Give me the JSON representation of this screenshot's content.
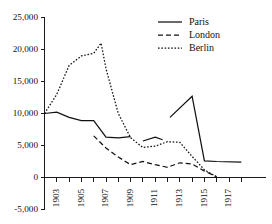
{
  "chart_data": {
    "type": "line",
    "title": "",
    "subtitle": "",
    "xlabel": "",
    "ylabel": "",
    "xlim": [
      1902,
      1918
    ],
    "ylim": [
      -5000,
      25000
    ],
    "grid": false,
    "legend_position": "top-right",
    "x": [
      1902,
      1903,
      1904,
      1905,
      1906,
      1907,
      1908,
      1909,
      1910,
      1911,
      1912,
      1913,
      1914,
      1915,
      1916,
      1917,
      1918
    ],
    "y_ticks": [
      -5000,
      0,
      5000,
      10000,
      15000,
      20000,
      25000
    ],
    "y_tick_labels": [
      "-5,000",
      "0",
      "5,000",
      "10,000",
      "15,000",
      "20,000",
      "25,000"
    ],
    "x_ticks": [
      1902,
      1903,
      1904,
      1905,
      1906,
      1907,
      1908,
      1909,
      1910,
      1911,
      1912,
      1913,
      1914,
      1915,
      1916,
      1917,
      1918
    ],
    "x_tick_labels": [
      "",
      "1903",
      "",
      "1905",
      "",
      "1907",
      "",
      "1909",
      "",
      "1911",
      "",
      "1913",
      "",
      "1915",
      "",
      "1917",
      ""
    ],
    "series": [
      {
        "name": "Paris",
        "style": "solid",
        "points": [
          {
            "x": 1902,
            "y": 10000
          },
          {
            "x": 1903,
            "y": 10200
          },
          {
            "x": 1904,
            "y": 9400
          },
          {
            "x": 1905,
            "y": 8900
          },
          {
            "x": 1906,
            "y": 8900
          },
          {
            "x": 1907,
            "y": 6300
          },
          {
            "x": 1908,
            "y": 6200
          },
          {
            "x": 1909,
            "y": 6400
          }
        ],
        "points_segment2": [
          {
            "x": 1910,
            "y": 5700
          },
          {
            "x": 1911,
            "y": 6300
          },
          {
            "x": 1911.6,
            "y": 5900
          }
        ],
        "points_segment3": [
          {
            "x": 1912.2,
            "y": 9400
          },
          {
            "x": 1914,
            "y": 12700
          },
          {
            "x": 1915,
            "y": 2600
          },
          {
            "x": 1916,
            "y": 2500
          },
          {
            "x": 1918,
            "y": 2400
          }
        ]
      },
      {
        "name": "London",
        "style": "dashed",
        "points": [
          {
            "x": 1906,
            "y": 6500
          },
          {
            "x": 1907,
            "y": 4600
          },
          {
            "x": 1908,
            "y": 3200
          },
          {
            "x": 1909,
            "y": 2000
          },
          {
            "x": 1910,
            "y": 2500
          },
          {
            "x": 1911,
            "y": 2000
          },
          {
            "x": 1912,
            "y": 1600
          },
          {
            "x": 1913,
            "y": 2300
          },
          {
            "x": 1914,
            "y": 2100
          },
          {
            "x": 1915,
            "y": 1000
          },
          {
            "x": 1916,
            "y": 100
          }
        ]
      },
      {
        "name": "Berlin",
        "style": "dotted",
        "points": [
          {
            "x": 1902,
            "y": 10000
          },
          {
            "x": 1903,
            "y": 13000
          },
          {
            "x": 1904,
            "y": 17500
          },
          {
            "x": 1905,
            "y": 19000
          },
          {
            "x": 1906,
            "y": 19400
          },
          {
            "x": 1906.6,
            "y": 21000
          },
          {
            "x": 1907,
            "y": 17000
          },
          {
            "x": 1908,
            "y": 10000
          },
          {
            "x": 1909,
            "y": 6200
          },
          {
            "x": 1910,
            "y": 4700
          },
          {
            "x": 1911,
            "y": 4900
          },
          {
            "x": 1912,
            "y": 5600
          },
          {
            "x": 1913,
            "y": 5500
          },
          {
            "x": 1914,
            "y": 3300
          },
          {
            "x": 1915,
            "y": 1200
          },
          {
            "x": 1916,
            "y": 100
          }
        ]
      }
    ]
  },
  "legend": {
    "entries": [
      {
        "label": "Paris",
        "style": "solid"
      },
      {
        "label": "London",
        "style": "dashed"
      },
      {
        "label": "Berlin",
        "style": "dotted"
      }
    ]
  }
}
